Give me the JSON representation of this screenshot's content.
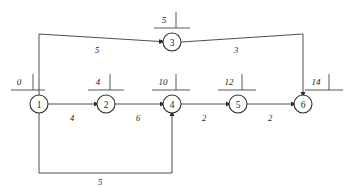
{
  "diagram": {
    "type": "activity-on-node network / CPM project network",
    "canvas": {
      "width": 350,
      "height": 188,
      "background": "#ffffff"
    },
    "stroke_color": "#3a3a3a",
    "node_stroke_color": "#2e2e2e",
    "text_color": "#1c1c1c",
    "nodes": [
      {
        "id": "1",
        "label": "1",
        "cx": 39,
        "cy": 104,
        "r": 9,
        "marker": {
          "value": "0",
          "vx": 19,
          "vy": 82,
          "rule_x1": 11,
          "rule_x2": 45,
          "rule_y": 90,
          "tick_x": 33,
          "tick_y1": 90,
          "tick_y2": 74
        }
      },
      {
        "id": "2",
        "label": "2",
        "cx": 106,
        "cy": 104,
        "r": 9,
        "marker": {
          "value": "4",
          "vx": 98,
          "vy": 82,
          "rule_x1": 88,
          "rule_x2": 124,
          "rule_y": 90,
          "tick_x": 110,
          "tick_y1": 90,
          "tick_y2": 74
        }
      },
      {
        "id": "3",
        "label": "3",
        "cx": 172,
        "cy": 42,
        "r": 9,
        "marker": {
          "value": "5",
          "vx": 164,
          "vy": 20,
          "rule_x1": 154,
          "rule_x2": 190,
          "rule_y": 28,
          "tick_x": 176,
          "tick_y1": 28,
          "tick_y2": 12
        }
      },
      {
        "id": "4",
        "label": "4",
        "cx": 172,
        "cy": 104,
        "r": 9,
        "marker": {
          "value": "10",
          "vx": 163,
          "vy": 82,
          "rule_x1": 152,
          "rule_x2": 190,
          "rule_y": 90,
          "tick_x": 176,
          "tick_y1": 90,
          "tick_y2": 74
        }
      },
      {
        "id": "5",
        "label": "5",
        "cx": 238,
        "cy": 104,
        "r": 9,
        "marker": {
          "value": "12",
          "vx": 229,
          "vy": 82,
          "rule_x1": 218,
          "rule_x2": 256,
          "rule_y": 90,
          "tick_x": 242,
          "tick_y1": 90,
          "tick_y2": 74
        }
      },
      {
        "id": "6",
        "label": "6",
        "cx": 303,
        "cy": 104,
        "r": 9,
        "marker": {
          "value": "14",
          "vx": 316,
          "vy": 82,
          "rule_x1": 305,
          "rule_x2": 343,
          "rule_y": 90,
          "tick_x": 329,
          "tick_y1": 90,
          "tick_y2": 74
        }
      }
    ],
    "edges": [
      {
        "from": "1",
        "to": "2",
        "weight": "4",
        "path": "M 48.5 104 L 95 104",
        "arrow": {
          "x": 96.5,
          "y": 104,
          "dir": "right"
        },
        "label_x": 72,
        "label_y": 118
      },
      {
        "from": "2",
        "to": "4",
        "weight": "6",
        "path": "M 115.5 104 L 161 104",
        "arrow": {
          "x": 162.5,
          "y": 104,
          "dir": "right"
        },
        "label_x": 138,
        "label_y": 118
      },
      {
        "from": "4",
        "to": "5",
        "weight": "2",
        "path": "M 181.5 104 L 227 104",
        "arrow": {
          "x": 228.5,
          "y": 104,
          "dir": "right"
        },
        "label_x": 204,
        "label_y": 118
      },
      {
        "from": "5",
        "to": "6",
        "weight": "2",
        "path": "M 247.5 104 L 292 104",
        "arrow": {
          "x": 293.5,
          "y": 104,
          "dir": "right"
        },
        "label_x": 270,
        "label_y": 118
      },
      {
        "from": "1",
        "to": "3",
        "weight": "5",
        "path": "M 39 95 L 39 34 L 160 41.5",
        "arrow": {
          "x": 161.5,
          "y": 41.6,
          "dir": "right"
        },
        "label_x": 97,
        "label_y": 50
      },
      {
        "from": "3",
        "to": "6",
        "weight": "3",
        "path": "M 181.5 42 L 303 34 L 303 93",
        "arrow": {
          "x": 303,
          "y": 94.5,
          "dir": "down"
        },
        "label_x": 236,
        "label_y": 50
      },
      {
        "from": "1",
        "to": "4",
        "weight": "5",
        "path": "M 39 113 L 39 173 L 172 173 L 172 115",
        "arrow": {
          "x": 172,
          "y": 113.5,
          "dir": "up"
        },
        "label_x": 100,
        "label_y": 182
      }
    ]
  }
}
